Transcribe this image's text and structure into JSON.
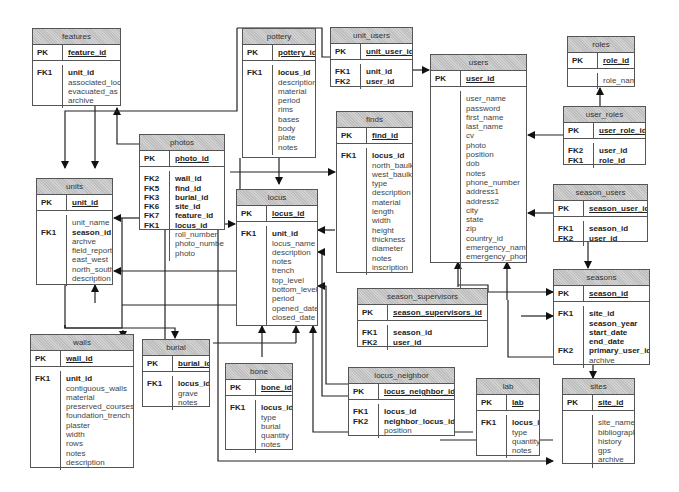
{
  "diagram": {
    "type": "entity-relationship",
    "tables": {
      "features": {
        "name": "features",
        "pk_label": "PK",
        "pk": "feature_id",
        "key_labels": [
          "FK1"
        ],
        "fields": [
          {
            "text": "unit_id",
            "bold": true
          },
          {
            "text": "associated_loci"
          },
          {
            "text": "evacuated_as"
          },
          {
            "text": "archive"
          }
        ]
      },
      "pottery": {
        "name": "pottery",
        "pk_label": "PK",
        "pk": "pottery_id",
        "key_labels": [
          "FK1"
        ],
        "fields": [
          {
            "text": "locus_id",
            "bold": true
          },
          {
            "text": "description"
          },
          {
            "text": "material"
          },
          {
            "text": "period"
          },
          {
            "text": "rims"
          },
          {
            "text": "bases"
          },
          {
            "text": "body"
          },
          {
            "text": "plate"
          },
          {
            "text": "notes"
          }
        ]
      },
      "unit_users": {
        "name": "unit_users",
        "pk_label": "PK",
        "pk": "unit_user_id",
        "key_labels": [
          "FK1",
          "FK2"
        ],
        "fields": [
          {
            "text": "unit_id",
            "bold": true
          },
          {
            "text": "user_id",
            "bold": true
          }
        ]
      },
      "users": {
        "name": "users",
        "pk_label": "PK",
        "pk": "user_id",
        "key_labels": [],
        "fields": [
          {
            "text": "user_name"
          },
          {
            "text": "password"
          },
          {
            "text": "first_name"
          },
          {
            "text": "last_name"
          },
          {
            "text": "cv"
          },
          {
            "text": "photo"
          },
          {
            "text": "position"
          },
          {
            "text": "dob"
          },
          {
            "text": "notes"
          },
          {
            "text": "phone_number"
          },
          {
            "text": "address1"
          },
          {
            "text": "address2"
          },
          {
            "text": "city"
          },
          {
            "text": "state"
          },
          {
            "text": "zip"
          },
          {
            "text": "country_id"
          },
          {
            "text": "emergency_name"
          },
          {
            "text": "emergency_phone"
          }
        ]
      },
      "roles": {
        "name": "roles",
        "pk_label": "PK",
        "pk": "role_id",
        "key_labels": [],
        "fields": [
          {
            "text": "role_name"
          }
        ]
      },
      "user_roles": {
        "name": "user_roles",
        "pk_label": "PK",
        "pk": "user_role_id",
        "key_labels": [
          "FK2",
          "FK1"
        ],
        "fields": [
          {
            "text": "user_id",
            "bold": true
          },
          {
            "text": "role_id",
            "bold": true
          }
        ]
      },
      "photos": {
        "name": "photos",
        "pk_label": "PK",
        "pk": "photo_id",
        "key_labels": [
          "FK2",
          "FK5",
          "FK3",
          "FK6",
          "FK7",
          "FK1"
        ],
        "fields": [
          {
            "text": "wall_id",
            "bold": true
          },
          {
            "text": "find_id",
            "bold": true
          },
          {
            "text": "burial_id",
            "bold": true
          },
          {
            "text": "site_id",
            "bold": true
          },
          {
            "text": "feature_id",
            "bold": true
          },
          {
            "text": "locus_id",
            "bold": true
          },
          {
            "text": "roll_number"
          },
          {
            "text": "photo_number"
          },
          {
            "text": "photo"
          }
        ]
      },
      "finds": {
        "name": "finds",
        "pk_label": "PK",
        "pk": "find_id",
        "key_labels": [
          "FK1"
        ],
        "fields": [
          {
            "text": "locus_id",
            "bold": true
          },
          {
            "text": "north_baulk"
          },
          {
            "text": "west_baulk"
          },
          {
            "text": "type"
          },
          {
            "text": "description"
          },
          {
            "text": "material"
          },
          {
            "text": "length"
          },
          {
            "text": "width"
          },
          {
            "text": "height"
          },
          {
            "text": "thickness"
          },
          {
            "text": "diameter"
          },
          {
            "text": "notes"
          },
          {
            "text": "inscription"
          }
        ]
      },
      "units": {
        "name": "units",
        "pk_label": "PK",
        "pk": "unit_id",
        "key_labels": [
          "",
          "FK1"
        ],
        "fields": [
          {
            "text": "unit_name"
          },
          {
            "text": "season_id",
            "bold": true
          },
          {
            "text": "archve"
          },
          {
            "text": "field_report"
          },
          {
            "text": "east_west"
          },
          {
            "text": "north_south"
          },
          {
            "text": "description"
          }
        ]
      },
      "locus": {
        "name": "locus",
        "pk_label": "PK",
        "pk": "locus_id",
        "key_labels": [
          "FK1"
        ],
        "fields": [
          {
            "text": "unit_id",
            "bold": true
          },
          {
            "text": "locus_name"
          },
          {
            "text": "description"
          },
          {
            "text": "notes"
          },
          {
            "text": "trench"
          },
          {
            "text": "top_level"
          },
          {
            "text": "bottom_level"
          },
          {
            "text": "period"
          },
          {
            "text": "opened_date"
          },
          {
            "text": "closed_date"
          }
        ]
      },
      "season_users": {
        "name": "season_users",
        "pk_label": "PK",
        "pk": "season_user_id",
        "key_labels": [
          "FK1",
          "FK2"
        ],
        "fields": [
          {
            "text": "season_id",
            "bold": true
          },
          {
            "text": "user_id",
            "bold": true
          }
        ]
      },
      "seasons": {
        "name": "seasons",
        "pk_label": "PK",
        "pk": "season_id",
        "key_labels": [
          "FK1",
          "",
          "",
          "",
          "FK2"
        ],
        "fields": [
          {
            "text": "site_id",
            "bold": true
          },
          {
            "text": "season_year",
            "bold": true
          },
          {
            "text": "start_date",
            "bold": true
          },
          {
            "text": "end_date",
            "bold": true
          },
          {
            "text": "primary_user_id",
            "bold": true
          },
          {
            "text": "archive"
          }
        ]
      },
      "season_supervisors": {
        "name": "season_supervisors",
        "pk_label": "PK",
        "pk": "season_supervisors_id",
        "key_labels": [
          "FK1",
          "FK2"
        ],
        "fields": [
          {
            "text": "season_id",
            "bold": true
          },
          {
            "text": "user_id",
            "bold": true
          }
        ]
      },
      "walls": {
        "name": "walls",
        "pk_label": "PK",
        "pk": "wall_id",
        "key_labels": [
          "FK1"
        ],
        "fields": [
          {
            "text": "unit_id",
            "bold": true
          },
          {
            "text": "contiguous_walls"
          },
          {
            "text": "material"
          },
          {
            "text": "preserved_courses"
          },
          {
            "text": "foundation_trench"
          },
          {
            "text": "plaster"
          },
          {
            "text": "width"
          },
          {
            "text": "rows"
          },
          {
            "text": "notes"
          },
          {
            "text": "description"
          }
        ]
      },
      "burial": {
        "name": "burial",
        "pk_label": "PK",
        "pk": "burial_id",
        "key_labels": [
          "FK1"
        ],
        "fields": [
          {
            "text": "locus_id",
            "bold": true
          },
          {
            "text": "grave"
          },
          {
            "text": "notes"
          }
        ]
      },
      "bone": {
        "name": "bone",
        "pk_label": "PK",
        "pk": "bone_id",
        "key_labels": [
          "FK1"
        ],
        "fields": [
          {
            "text": "locus_id",
            "bold": true
          },
          {
            "text": "type"
          },
          {
            "text": "burial"
          },
          {
            "text": "quantity"
          },
          {
            "text": "notes"
          }
        ]
      },
      "locus_neighbor": {
        "name": "locus_neighbor",
        "pk_label": "PK",
        "pk": "locus_neighbor_id",
        "key_labels": [
          "FK1",
          "FK2"
        ],
        "fields": [
          {
            "text": "locus_id",
            "bold": true
          },
          {
            "text": "neighbor_locus_id",
            "bold": true
          },
          {
            "text": "position"
          }
        ]
      },
      "lab": {
        "name": "lab",
        "pk_label": "PK",
        "pk": "lab",
        "key_labels": [
          "FK1"
        ],
        "fields": [
          {
            "text": "locus_id",
            "bold": true
          },
          {
            "text": "type"
          },
          {
            "text": "quantity"
          },
          {
            "text": "notes"
          }
        ]
      },
      "sites": {
        "name": "sites",
        "pk_label": "PK",
        "pk": "site_id",
        "key_labels": [],
        "fields": [
          {
            "text": "site_name"
          },
          {
            "text": "bibliography"
          },
          {
            "text": "history"
          },
          {
            "text": "gps"
          },
          {
            "text": "archive"
          }
        ]
      }
    },
    "relationships": [
      {
        "from": "features",
        "to": "units"
      },
      {
        "from": "photos",
        "to": "features"
      },
      {
        "from": "photos",
        "to": "units"
      },
      {
        "from": "photos",
        "to": "locus"
      },
      {
        "from": "photos",
        "to": "walls"
      },
      {
        "from": "photos",
        "to": "burial"
      },
      {
        "from": "photos",
        "to": "sites"
      },
      {
        "from": "pottery",
        "to": "locus"
      },
      {
        "from": "unit_users",
        "to": "users"
      },
      {
        "from": "unit_users",
        "to": "units"
      },
      {
        "from": "user_roles",
        "to": "roles"
      },
      {
        "from": "user_roles",
        "to": "users"
      },
      {
        "from": "finds",
        "to": "locus"
      },
      {
        "from": "locus",
        "to": "units"
      },
      {
        "from": "walls",
        "to": "units"
      },
      {
        "from": "burial",
        "to": "locus"
      },
      {
        "from": "bone",
        "to": "locus"
      },
      {
        "from": "locus_neighbor",
        "to": "locus"
      },
      {
        "from": "lab",
        "to": "locus"
      },
      {
        "from": "season_users",
        "to": "users"
      },
      {
        "from": "season_users",
        "to": "seasons"
      },
      {
        "from": "season_supervisors",
        "to": "users"
      },
      {
        "from": "season_supervisors",
        "to": "seasons"
      },
      {
        "from": "seasons",
        "to": "sites"
      },
      {
        "from": "seasons",
        "to": "users"
      }
    ]
  }
}
